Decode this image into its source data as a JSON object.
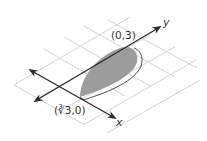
{
  "diagram": {
    "type": "isometric-region",
    "axes": {
      "x_label": "x",
      "y_label": "y"
    },
    "points": [
      {
        "label": "(0,3)"
      },
      {
        "label": "(∛3,0)"
      }
    ],
    "colors": {
      "grid": "#c8c8c8",
      "axis": "#2b2b2b",
      "region_fill": "#9c9c9c",
      "outline": "#3a3a3a",
      "text": "#333333"
    }
  }
}
